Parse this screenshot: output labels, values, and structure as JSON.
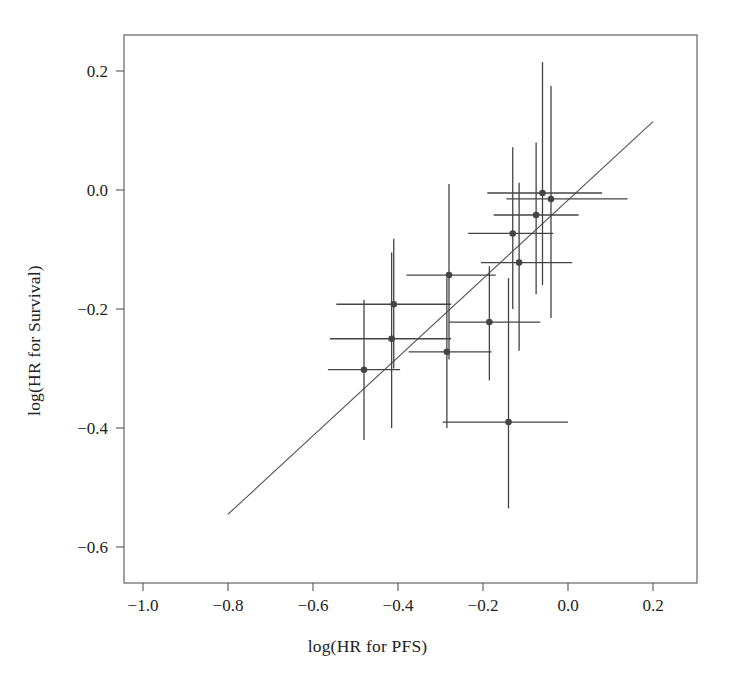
{
  "figure": {
    "background": "#ffffff",
    "frame_color": "#555555",
    "marker_color": "#444444",
    "errorbar_color": "#444444",
    "line_color": "#555555"
  },
  "chart_data": {
    "type": "scatter",
    "title": "",
    "xlabel": "log(HR for PFS)",
    "ylabel": "log(HR for Survival)",
    "xlim": [
      -1.08,
      0.3
    ],
    "ylim": [
      -0.66,
      0.27
    ],
    "grid": false,
    "legend": null,
    "xticks": [
      -1.0,
      -0.8,
      -0.6,
      -0.4,
      -0.2,
      0.0,
      0.2
    ],
    "xticklabels": [
      "-1.0",
      "-0.8",
      "-0.6",
      "-0.4",
      "-0.2",
      "0.0",
      "0.2"
    ],
    "yticks": [
      0.2,
      0.0,
      -0.2,
      -0.4,
      -0.6
    ],
    "yticklabels": [
      "0.2",
      "0.0",
      "-0.2",
      "-0.4",
      "-0.6"
    ],
    "fit_line": {
      "x0": -0.8,
      "y0": -0.545,
      "x1": 0.2,
      "y1": 0.115
    },
    "points": [
      {
        "x": -0.48,
        "y": -0.302,
        "xlo": -0.565,
        "xhi": -0.395,
        "ylo": -0.42,
        "yhi": -0.185
      },
      {
        "x": -0.415,
        "y": -0.25,
        "xlo": -0.56,
        "xhi": -0.275,
        "ylo": -0.4,
        "yhi": -0.105
      },
      {
        "x": -0.41,
        "y": -0.192,
        "xlo": -0.545,
        "xhi": -0.275,
        "ylo": -0.3,
        "yhi": -0.082
      },
      {
        "x": -0.285,
        "y": -0.272,
        "xlo": -0.375,
        "xhi": -0.18,
        "ylo": -0.4,
        "yhi": -0.148
      },
      {
        "x": -0.28,
        "y": -0.143,
        "xlo": -0.38,
        "xhi": -0.17,
        "ylo": -0.285,
        "yhi": 0.01
      },
      {
        "x": -0.185,
        "y": -0.222,
        "xlo": -0.28,
        "xhi": -0.065,
        "ylo": -0.32,
        "yhi": -0.128
      },
      {
        "x": -0.14,
        "y": -0.39,
        "xlo": -0.295,
        "xhi": 0.0,
        "ylo": -0.535,
        "yhi": -0.148
      },
      {
        "x": -0.13,
        "y": -0.073,
        "xlo": -0.235,
        "xhi": -0.035,
        "ylo": -0.2,
        "yhi": 0.072
      },
      {
        "x": -0.115,
        "y": -0.122,
        "xlo": -0.205,
        "xhi": 0.01,
        "ylo": -0.27,
        "yhi": 0.012
      },
      {
        "x": -0.075,
        "y": -0.042,
        "xlo": -0.175,
        "xhi": 0.025,
        "ylo": -0.175,
        "yhi": 0.08
      },
      {
        "x": -0.06,
        "y": -0.005,
        "xlo": -0.19,
        "xhi": 0.08,
        "ylo": -0.16,
        "yhi": 0.215
      },
      {
        "x": -0.04,
        "y": -0.015,
        "xlo": -0.145,
        "xhi": 0.14,
        "ylo": -0.215,
        "yhi": 0.175
      }
    ]
  }
}
